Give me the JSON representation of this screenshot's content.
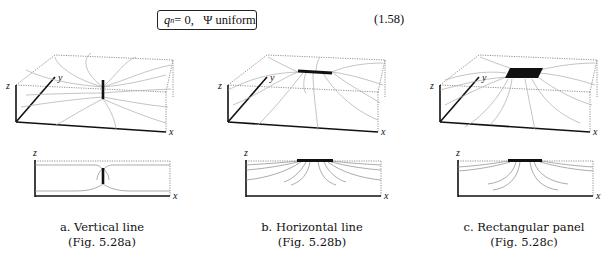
{
  "equation": {
    "boxed_text": "q_n = 0,   Ψ uniform",
    "lhs": "q",
    "subscript": "n",
    "rest": " = 0,",
    "psi": "Ψ uniform",
    "number": "(1.58)"
  },
  "axis_labels": {
    "x": "x",
    "y": "y",
    "z": "z"
  },
  "panels": [
    {
      "id": "a",
      "title": "a. Vertical line",
      "ref": "(Fig. 5.28a)",
      "source": "vertical-line"
    },
    {
      "id": "b",
      "title": "b. Horizontal line",
      "ref": "(Fig. 5.28b)",
      "source": "horizontal-line"
    },
    {
      "id": "c",
      "title": "c. Rectangular panel",
      "ref": "(Fig. 5.28c)",
      "source": "rectangular-panel"
    }
  ],
  "colors": {
    "ink": "#111111",
    "streamline": "#aaaaaa",
    "dotted": "#777777",
    "background": "#ffffff"
  }
}
